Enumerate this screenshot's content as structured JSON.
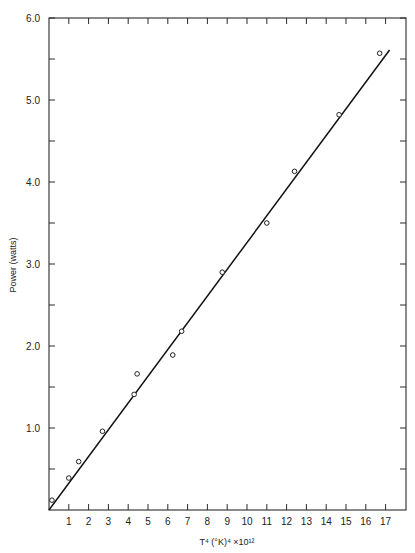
{
  "chart_data": {
    "type": "scatter",
    "title": "",
    "xlabel": "T⁴ (°K)⁴ ×10¹²",
    "ylabel": "Power (watts)",
    "xlim": [
      0,
      17.9
    ],
    "ylim": [
      0,
      6.0
    ],
    "grid": false,
    "legend": null,
    "x_ticks": [
      1,
      2,
      3,
      4,
      5,
      6,
      7,
      8,
      9,
      10,
      11,
      12,
      13,
      14,
      15,
      16,
      17
    ],
    "x_tick_labels": [
      "1",
      "2",
      "3",
      "4",
      "5",
      "6",
      "7",
      "8",
      "9",
      "10",
      "11",
      "12",
      "13",
      "14",
      "15",
      "16",
      "17"
    ],
    "y_major_ticks": [
      1.0,
      2.0,
      3.0,
      4.0,
      5.0,
      6.0
    ],
    "y_tick_labels": [
      "1.0",
      "2.0",
      "3.0",
      "4.0",
      "5.0",
      "6.0"
    ],
    "y_minor_ticks": [
      0.5,
      1.5,
      2.5,
      3.5,
      4.5,
      5.5
    ],
    "series": [
      {
        "name": "Measured points",
        "marker": "open-circle",
        "x": [
          0.15,
          1.0,
          1.5,
          2.7,
          4.3,
          4.45,
          6.25,
          6.7,
          8.75,
          11.0,
          12.4,
          14.65,
          16.7
        ],
        "y": [
          0.12,
          0.39,
          0.59,
          0.96,
          1.41,
          1.66,
          1.89,
          2.18,
          2.9,
          3.5,
          4.13,
          4.82,
          5.57
        ]
      },
      {
        "name": "Fitted line",
        "style": "solid-line",
        "x": [
          0.0,
          17.2
        ],
        "y": [
          0.0,
          5.61
        ]
      }
    ]
  },
  "plot": {
    "x_axis_title": "T⁴ (°K)⁴ ×10¹²",
    "y_axis_title": "Power (watts)"
  }
}
